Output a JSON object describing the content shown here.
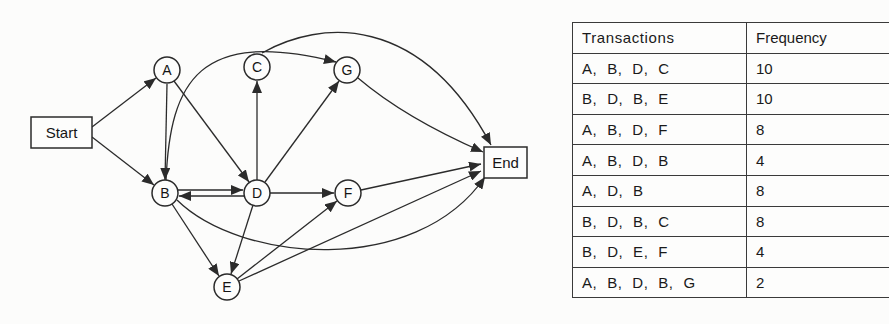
{
  "figure": {
    "type": "process-model-with-log",
    "colors": {
      "line": "#2b2b2b",
      "node_fill": "#fdfdfc",
      "text": "#151515",
      "background": "#fcfcfb"
    }
  },
  "diagram": {
    "nodes": [
      {
        "id": "Start",
        "label": "Start",
        "shape": "rect",
        "x": 61.5,
        "y": 132.5,
        "w": 61,
        "h": 31
      },
      {
        "id": "A",
        "label": "A",
        "shape": "circle",
        "x": 167,
        "y": 70,
        "r": 13
      },
      {
        "id": "C",
        "label": "C",
        "shape": "circle",
        "x": 257,
        "y": 67,
        "r": 13
      },
      {
        "id": "G",
        "label": "G",
        "shape": "circle",
        "x": 347,
        "y": 70,
        "r": 13
      },
      {
        "id": "B",
        "label": "B",
        "shape": "circle",
        "x": 165,
        "y": 193,
        "r": 13
      },
      {
        "id": "D",
        "label": "D",
        "shape": "circle",
        "x": 257,
        "y": 193,
        "r": 13
      },
      {
        "id": "F",
        "label": "F",
        "shape": "circle",
        "x": 348,
        "y": 193,
        "r": 13
      },
      {
        "id": "E",
        "label": "E",
        "shape": "circle",
        "x": 227,
        "y": 287,
        "r": 13
      },
      {
        "id": "End",
        "label": "End",
        "shape": "rect",
        "x": 505.5,
        "y": 162.5,
        "w": 43,
        "h": 31
      }
    ],
    "edges": [
      {
        "from": "Start",
        "to": "A",
        "path": "M92,127 L156,78"
      },
      {
        "from": "Start",
        "to": "B",
        "path": "M92,137 L154,185"
      },
      {
        "from": "A",
        "to": "B",
        "path": "M167,84 L165,180"
      },
      {
        "from": "A",
        "to": "D",
        "path": "M174,81 L249,182"
      },
      {
        "from": "B",
        "to": "D",
        "path": "M178,190 L243,190"
      },
      {
        "from": "D",
        "to": "B",
        "path": "M244,196 L179,196"
      },
      {
        "from": "B",
        "to": "E",
        "path": "M172,204 L219,276"
      },
      {
        "from": "D",
        "to": "E",
        "path": "M253,205 L231,274"
      },
      {
        "from": "D",
        "to": "C",
        "path": "M257,180 L257,81"
      },
      {
        "from": "D",
        "to": "G",
        "path": "M265,182 L339,81"
      },
      {
        "from": "D",
        "to": "F",
        "path": "M270,193 L334,193"
      },
      {
        "from": "E",
        "to": "F",
        "path": "M237,279 L337,201"
      },
      {
        "from": "B",
        "to": "G",
        "path": "M166,181 C170,80 200,28 336,62"
      },
      {
        "from": "C",
        "to": "End",
        "path": "M262,53 C320,20 420,12 491,145"
      },
      {
        "from": "G",
        "to": "End",
        "path": "M358,78 Q405,118 483,152"
      },
      {
        "from": "F",
        "to": "End",
        "path": "M361,190 L481,164"
      },
      {
        "from": "E",
        "to": "End",
        "path": "M239,281 L481,171"
      },
      {
        "from": "B",
        "to": "End",
        "path": "M177,200 C240,262 415,278 485,177"
      }
    ]
  },
  "table": {
    "headers": [
      "Transactions",
      "Frequency"
    ],
    "rows": [
      {
        "transaction": "A, B, D, C",
        "frequency": "10"
      },
      {
        "transaction": "B, D, B, E",
        "frequency": "10"
      },
      {
        "transaction": "A, B, D, F",
        "frequency": "8"
      },
      {
        "transaction": "A, B, D, B",
        "frequency": "4"
      },
      {
        "transaction": "A, D, B",
        "frequency": "8"
      },
      {
        "transaction": "B, D, B, C",
        "frequency": "8"
      },
      {
        "transaction": "B, D, E, F",
        "frequency": "4"
      },
      {
        "transaction": "A, B, D, B, G",
        "frequency": "2"
      }
    ]
  }
}
